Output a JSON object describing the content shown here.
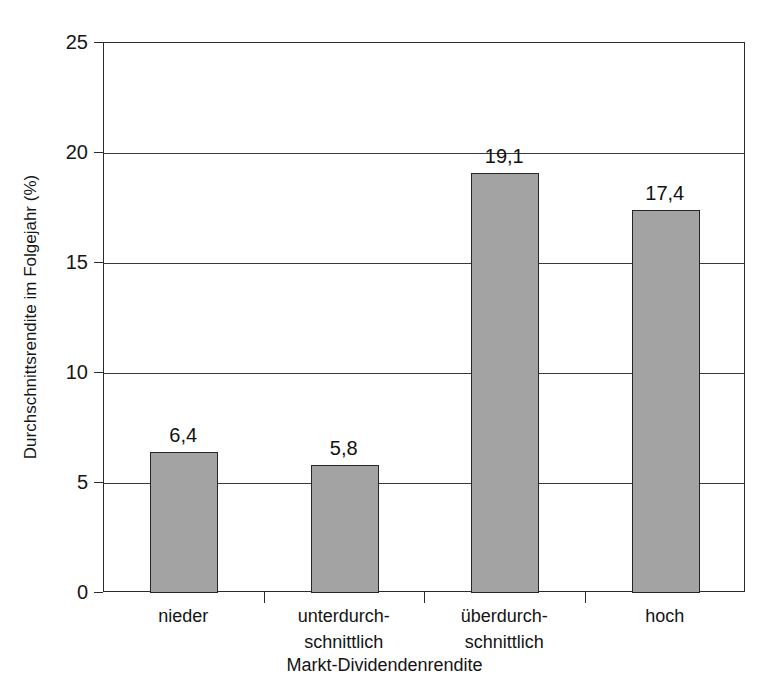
{
  "chart_data": {
    "type": "bar",
    "title": "",
    "xlabel": "Markt-Dividendenrendite",
    "ylabel": "Durchschnittsrendite im Folgejahr (%)",
    "categories": [
      "nieder",
      "unterdurch-\nschnittlich",
      "überdurch-\nschnittlich",
      "hoch"
    ],
    "category_lines": [
      [
        "nieder"
      ],
      [
        "unterdurch-",
        "schnittlich"
      ],
      [
        "überdurch-",
        "schnittlich"
      ],
      [
        "hoch"
      ]
    ],
    "values": [
      6.4,
      5.8,
      19.1,
      17.4
    ],
    "value_labels": [
      "6,4",
      "5,8",
      "19,1",
      "17,4"
    ],
    "ylim": [
      0,
      25
    ],
    "ytick_values": [
      0,
      5,
      10,
      15,
      20,
      25
    ],
    "ytick_labels": [
      "0",
      "5",
      "10",
      "15",
      "20",
      "25"
    ],
    "grid": "horizontal",
    "legend": "none",
    "bar_color": "#a3a3a3",
    "bar_edge_color": "#262626",
    "axis_color": "#2b2b2b",
    "background_color": "#ffffff"
  },
  "figure": {
    "title_remnant": "Abbildung"
  }
}
